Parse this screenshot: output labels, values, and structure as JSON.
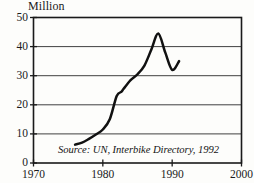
{
  "chart_data": {
    "type": "line",
    "title": "",
    "subtitle": "",
    "unit_label": "Million",
    "xlabel": "",
    "ylabel": "Million",
    "xlim": [
      1970,
      2000
    ],
    "ylim": [
      0,
      50
    ],
    "grid": true,
    "grid_axis": "y",
    "legend": false,
    "legend_position": "none",
    "x_ticks": [
      1970,
      1980,
      1990,
      2000
    ],
    "x_tick_labels": [
      "1970",
      "1980",
      "1990",
      "2000"
    ],
    "y_ticks": [
      0,
      10,
      20,
      30,
      40,
      50
    ],
    "y_tick_labels": [
      "0",
      "10",
      "20",
      "30",
      "40",
      "50"
    ],
    "annotations": [
      {
        "name": "source-note",
        "text": "Source: UN, Interbike Directory, 1992",
        "style": "italic",
        "x": 1974.5,
        "y": 5.5
      }
    ],
    "series": [
      {
        "name": "World Bicycle Production",
        "color": "#111111",
        "x": [
          1976,
          1977,
          1978,
          1979,
          1980,
          1981,
          1982,
          1982.7,
          1983,
          1984,
          1985,
          1986,
          1987,
          1988,
          1989,
          1990,
          1991
        ],
        "values": [
          6.3,
          7.0,
          8.3,
          9.8,
          11.5,
          15.0,
          23.0,
          24.5,
          25.5,
          28.5,
          30.5,
          33.5,
          39.0,
          44.5,
          38.0,
          32.0,
          35.0
        ]
      }
    ]
  },
  "axes": {
    "y_unit_caption": "Million"
  }
}
